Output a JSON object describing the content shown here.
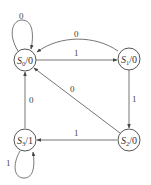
{
  "diagram": {
    "type": "state-diagram (Moore machine)",
    "colors": {
      "background": "#ffffff",
      "stroke": "#555555",
      "text": "#333333"
    },
    "states": [
      {
        "id": "S0",
        "name": "S",
        "sub": "0",
        "output": "/0",
        "label": "S0/0",
        "cx": 25,
        "cy": 60
      },
      {
        "id": "S1",
        "name": "S",
        "sub": "1",
        "output": "/0",
        "label": "S1/0",
        "cx": 129,
        "cy": 59
      },
      {
        "id": "S2",
        "name": "S",
        "sub": "2",
        "output": "/0",
        "label": "S2/0",
        "cx": 129,
        "cy": 140
      },
      {
        "id": "S3",
        "name": "S",
        "sub": "3",
        "output": "/1",
        "label": "S3/1",
        "cx": 25,
        "cy": 140
      }
    ],
    "transitions": [
      {
        "from": "S0",
        "to": "S0",
        "input": "0"
      },
      {
        "from": "S0",
        "to": "S1",
        "input": "1"
      },
      {
        "from": "S1",
        "to": "S0",
        "input": "0"
      },
      {
        "from": "S1",
        "to": "S2",
        "input": "1"
      },
      {
        "from": "S2",
        "to": "S0",
        "input": "0"
      },
      {
        "from": "S2",
        "to": "S3",
        "input": "1"
      },
      {
        "from": "S3",
        "to": "S0",
        "input": "0"
      },
      {
        "from": "S3",
        "to": "S3",
        "input": "1"
      }
    ]
  }
}
